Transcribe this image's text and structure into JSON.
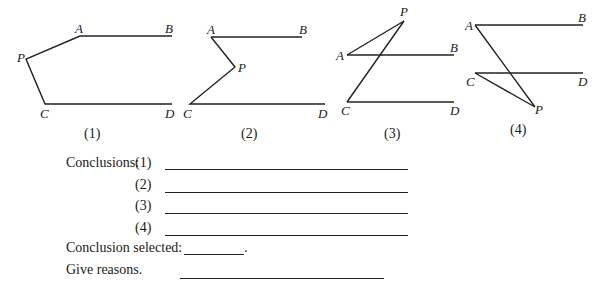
{
  "figures": [
    {
      "caption": "(1)",
      "points": {
        "A": "A",
        "B": "B",
        "P": "P",
        "C": "C",
        "D": "D"
      }
    },
    {
      "caption": "(2)",
      "points": {
        "A": "A",
        "B": "B",
        "P": "P",
        "C": "C",
        "D": "D"
      }
    },
    {
      "caption": "(3)",
      "points": {
        "A": "A",
        "B": "B",
        "P": "P",
        "C": "C",
        "D": "D"
      }
    },
    {
      "caption": "(4)",
      "points": {
        "A": "A",
        "B": "B",
        "P": "P",
        "C": "C",
        "D": "D"
      }
    }
  ],
  "conclusions": {
    "label": "Conclusions:",
    "items": [
      "(1)",
      "(2)",
      "(3)",
      "(4)"
    ]
  },
  "selected": {
    "label": "Conclusion selected:",
    "suffix": "."
  },
  "reasons": {
    "label": "Give reasons."
  }
}
